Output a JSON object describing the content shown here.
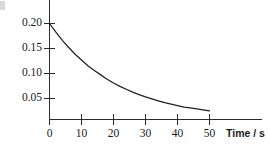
{
  "chart_data": {
    "type": "line",
    "title": "",
    "subtitle": "",
    "xlabel": "Time / s",
    "ylabel": "",
    "xlim": [
      0,
      57
    ],
    "ylim": [
      0,
      0.223
    ],
    "grid": false,
    "legend": "none",
    "x_ticks": [
      0,
      10,
      20,
      30,
      40,
      50
    ],
    "x_tick_labels": [
      "0",
      "10",
      "20",
      "30",
      "40",
      "50"
    ],
    "y_ticks": [
      0.05,
      0.1,
      0.15,
      0.2
    ],
    "y_tick_labels": [
      "0.05",
      "0.10",
      "0.15",
      "0.20"
    ],
    "annotations": [],
    "series": [
      {
        "name": "exponential decay",
        "color": "#231f20",
        "x": [
          0,
          2,
          4,
          6,
          8,
          10,
          12,
          14,
          16,
          18,
          20,
          22,
          24,
          26,
          28,
          30,
          32,
          34,
          36,
          38,
          40,
          42,
          44,
          46,
          48,
          50
        ],
        "y": [
          0.2,
          0.182,
          0.165,
          0.15,
          0.136,
          0.124,
          0.112,
          0.102,
          0.093,
          0.084,
          0.076,
          0.069,
          0.063,
          0.057,
          0.052,
          0.047,
          0.043,
          0.039,
          0.035,
          0.032,
          0.029,
          0.026,
          0.024,
          0.022,
          0.02,
          0.018
        ]
      }
    ]
  },
  "axis": {
    "x_title": "Time / s",
    "tick_0": "0",
    "tick_10": "10",
    "tick_20": "20",
    "tick_30": "30",
    "tick_40": "40",
    "tick_50": "50",
    "y_020": "0.20",
    "y_015": "0.15",
    "y_010": "0.10",
    "y_005": "0.05"
  }
}
